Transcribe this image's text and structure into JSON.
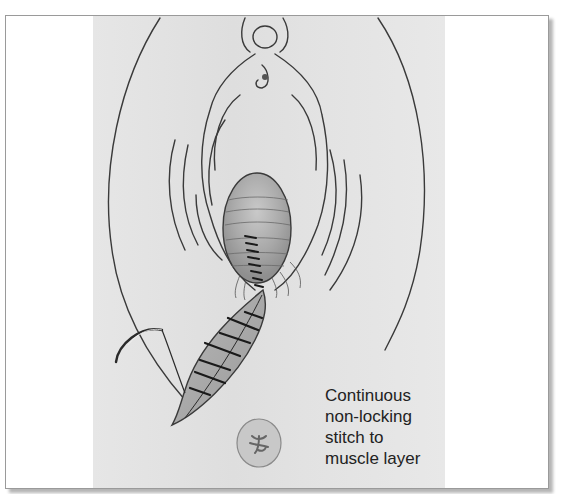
{
  "figure": {
    "caption_lines": [
      "Continuous",
      "non-locking",
      "stitch to",
      "muscle layer"
    ],
    "colors": {
      "panel": "#e0e0e0",
      "line": "#3a3a3a",
      "wound_fill": "#a8a8a8",
      "stitch": "#1a1a1a",
      "frame_border": "#9a9a9a"
    }
  }
}
